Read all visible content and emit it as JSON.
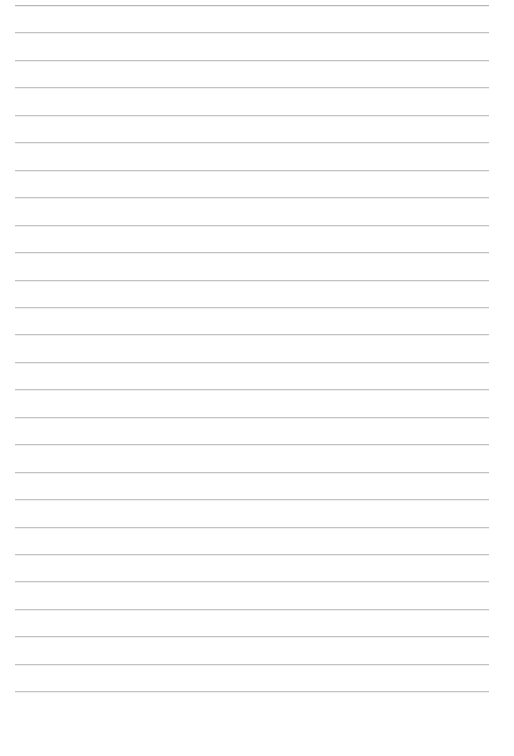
{
  "page": {
    "width_px": 514,
    "height_px": 756,
    "background_color": "#ffffff",
    "orientation": "portrait"
  },
  "ruling": {
    "name": "horizontal-ruled-lines",
    "line_color": "#c2c2c2",
    "first_line_color": "#b6b6b6",
    "line_thickness_px": 1,
    "line_count": 26,
    "line_spacing_px": 27.45,
    "first_line_y_px": 5,
    "last_line_y_px": 691,
    "left_margin_px": 15,
    "right_margin_px": 25,
    "line_length_px": 474,
    "bottom_margin_px": 65,
    "line_positions_y_px": [
      5,
      32.45,
      59.9,
      87.35,
      114.8,
      142.25,
      169.7,
      197.15,
      224.6,
      252.05,
      279.5,
      306.95,
      334.4,
      361.85,
      389.3,
      416.75,
      444.2,
      471.65,
      499.1,
      526.55,
      554,
      581.45,
      608.9,
      636.35,
      663.8,
      691.25
    ]
  },
  "content": {
    "lines_text": [
      "",
      "",
      "",
      "",
      "",
      "",
      "",
      "",
      "",
      "",
      "",
      "",
      "",
      "",
      "",
      "",
      "",
      "",
      "",
      "",
      "",
      "",
      "",
      "",
      "",
      ""
    ],
    "placeholder": ""
  }
}
